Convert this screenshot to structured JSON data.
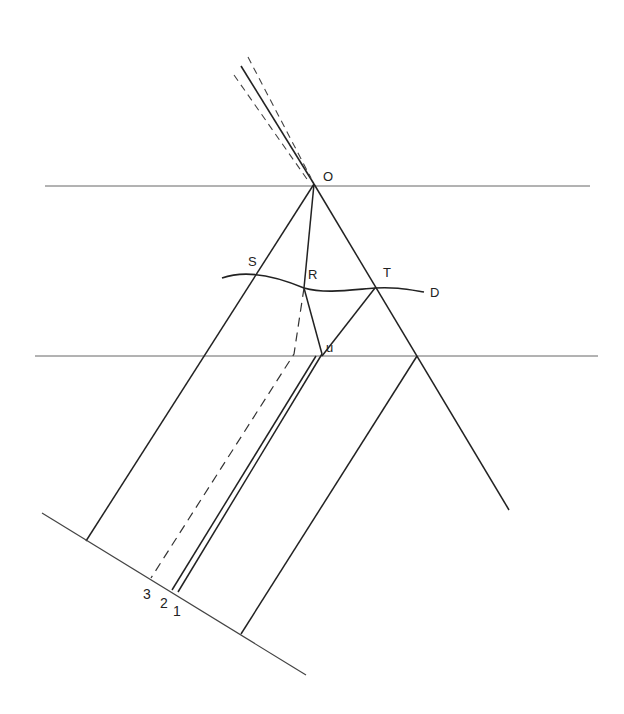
{
  "diagram": {
    "type": "ray-optics / refraction construction",
    "stroke_color": "#222222",
    "boundary_color": "#555555",
    "labels": {
      "O": "O",
      "S": "S",
      "R": "R",
      "T": "T",
      "D": "D",
      "u": "u",
      "n3": "3",
      "n2": "2",
      "n1": "1"
    },
    "points": {
      "O": [
        314,
        184
      ],
      "S": [
        254,
        272
      ],
      "R": [
        304,
        288
      ],
      "T": [
        375,
        288
      ],
      "u": [
        320,
        354
      ]
    },
    "incident_beam": {
      "solid": [
        [
          241,
          66
        ],
        [
          314,
          184
        ]
      ],
      "dashed_left": [
        [
          234,
          75
        ],
        [
          310,
          182
        ]
      ],
      "dashed_right": [
        [
          248,
          57
        ],
        [
          312,
          180
        ]
      ]
    },
    "boundaries": {
      "upper": {
        "y": 186,
        "x_start": 45,
        "x_end": 590
      },
      "lower": {
        "y": 356,
        "x_start": 35,
        "x_end": 598
      }
    },
    "curve_D": "M 222 278 C 250 268, 285 280, 304 288 C 325 294, 350 290, 375 288 C 395 287, 405 289, 424 292",
    "baseline": [
      [
        42,
        513
      ],
      [
        306,
        675
      ]
    ],
    "rays": [
      {
        "id": "OS-left",
        "points": [
          [
            314,
            184
          ],
          [
            86,
            541
          ]
        ]
      },
      {
        "id": "OR",
        "points": [
          [
            314,
            184
          ],
          [
            304,
            288
          ]
        ]
      },
      {
        "id": "R-u",
        "points": [
          [
            304,
            288
          ],
          [
            322,
            354
          ]
        ]
      },
      {
        "id": "ray-1",
        "points": [
          [
            322,
            354
          ],
          [
            178,
            592
          ]
        ]
      },
      {
        "id": "ray-2",
        "points": [
          [
            317,
            354
          ],
          [
            172,
            590
          ]
        ]
      },
      {
        "id": "ray-3-dashed-upper",
        "points": [
          [
            304,
            288
          ],
          [
            294,
            354
          ]
        ]
      },
      {
        "id": "ray-3-dashed-lower",
        "points": [
          [
            294,
            354
          ],
          [
            151,
            578
          ]
        ]
      },
      {
        "id": "OT",
        "points": [
          [
            314,
            184
          ],
          [
            417,
            356
          ]
        ]
      },
      {
        "id": "T-down",
        "points": [
          [
            375,
            288
          ],
          [
            241,
            634
          ]
        ]
      },
      {
        "id": "O-right-continue",
        "points": [
          [
            417,
            356
          ],
          [
            509,
            510
          ]
        ]
      },
      {
        "id": "right-refracted",
        "points": [
          [
            417,
            356
          ],
          [
            241,
            634
          ]
        ]
      }
    ]
  }
}
